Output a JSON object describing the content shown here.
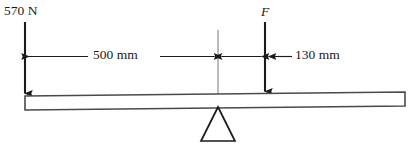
{
  "figure": {
    "type": "statics-free-body-diagram",
    "background_color": "#ffffff",
    "line_color": "#1a1a1a",
    "width": 415,
    "height": 151
  },
  "labels": {
    "load_left": "570 N",
    "force_f": "F",
    "dim_500": "500 mm",
    "dim_130": "130 mm"
  },
  "loads": [
    {
      "name": "left-load",
      "label": "570 N",
      "magnitude": 570,
      "unit": "N",
      "direction": "down",
      "x": 25
    },
    {
      "name": "applied-force",
      "label": "F",
      "magnitude": null,
      "unit": "N",
      "direction": "down",
      "x": 265
    }
  ],
  "dimensions": [
    {
      "name": "dim-left-span",
      "label": "500 mm",
      "value": 500,
      "unit": "mm",
      "from_x": 25,
      "to_x": 218
    },
    {
      "name": "dim-right-span",
      "label": "130 mm",
      "value": 130,
      "unit": "mm",
      "from_x": 218,
      "to_x": 265
    }
  ],
  "support": {
    "name": "fulcrum",
    "type": "knife-edge-triangle",
    "apex_x": 218
  },
  "beam": {
    "name": "beam",
    "left_x": 25,
    "right_x": 405,
    "thickness": 14
  }
}
